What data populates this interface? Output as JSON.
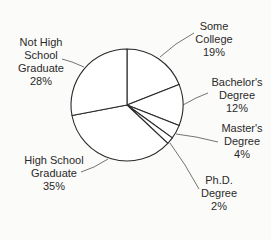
{
  "chart_data": {
    "type": "pie",
    "title": "",
    "start_angle_deg": 0,
    "direction": "clockwise",
    "categories": [
      "Some College",
      "Bachelor's Degree",
      "Master's Degree",
      "Ph.D. Degree",
      "High School Graduate",
      "Not High School Graduate"
    ],
    "values": [
      19,
      12,
      4,
      2,
      35,
      28
    ],
    "unit": "%",
    "slices": [
      {
        "label_lines": [
          "Some",
          "College"
        ],
        "value_text": "19%",
        "value": 19
      },
      {
        "label_lines": [
          "Bachelor's",
          "Degree"
        ],
        "value_text": "12%",
        "value": 12
      },
      {
        "label_lines": [
          "Master's",
          "Degree"
        ],
        "value_text": "4%",
        "value": 4
      },
      {
        "label_lines": [
          "Ph.D.",
          "Degree"
        ],
        "value_text": "2%",
        "value": 2
      },
      {
        "label_lines": [
          "High School",
          "Graduate"
        ],
        "value_text": "35%",
        "value": 35
      },
      {
        "label_lines": [
          "Not High",
          "School",
          "Graduate"
        ],
        "value_text": "28%",
        "value": 28
      }
    ],
    "legend": "none (callout labels)",
    "colors": {
      "fill": "#ffffff",
      "stroke": "#2a2a2a",
      "background": "#fbfbf9"
    }
  }
}
